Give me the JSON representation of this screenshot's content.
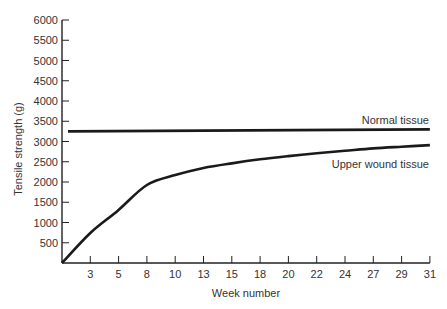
{
  "chart_data": {
    "type": "line",
    "title": "",
    "xlabel": "Week number",
    "ylabel": "Tensile strength (g)",
    "x_ticks": [
      "3",
      "5",
      "8",
      "10",
      "13",
      "15",
      "18",
      "20",
      "22",
      "24",
      "27",
      "29",
      "31"
    ],
    "y_ticks": [
      "500",
      "1000",
      "1500",
      "2000",
      "2500",
      "3000",
      "3500",
      "4000",
      "4500",
      "5000",
      "5500",
      "6000"
    ],
    "ylim": [
      0,
      6000
    ],
    "xlim": [
      0,
      31
    ],
    "grid": false,
    "legend": "none (inline labels at right end of lines)",
    "x": [
      0,
      3,
      5,
      8,
      10,
      13,
      15,
      18,
      20,
      22,
      24,
      27,
      29,
      31
    ],
    "series": [
      {
        "name": "Normal tissue",
        "values": [
          3250,
          3255,
          3260,
          3265,
          3268,
          3272,
          3275,
          3280,
          3283,
          3286,
          3290,
          3294,
          3297,
          3300
        ]
      },
      {
        "name": "Upper wound tissue",
        "values": [
          0,
          740,
          1310,
          1926,
          2170,
          2345,
          2460,
          2560,
          2640,
          2710,
          2770,
          2830,
          2870,
          2910
        ]
      }
    ],
    "annotations": [
      "Normal tissue",
      "Upper wound tissue"
    ]
  }
}
